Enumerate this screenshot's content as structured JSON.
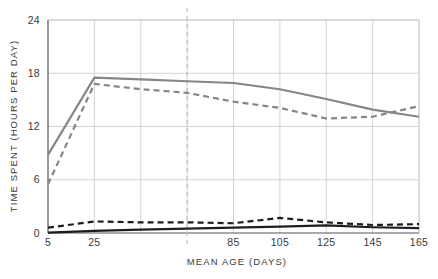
{
  "chart_data": {
    "type": "line",
    "title": "",
    "xlabel": "MEAN AGE (DAYS)",
    "ylabel": "TIME SPENT (HOURS PER DAY)",
    "xlim": [
      5,
      165
    ],
    "ylim": [
      0,
      24
    ],
    "grid": true,
    "legend": "none",
    "x_ticks": [
      5,
      25,
      45,
      65,
      85,
      105,
      125,
      145,
      165
    ],
    "x_tick_labels": [
      "5",
      "25",
      "",
      "",
      "85",
      "105",
      "125",
      "145",
      "165"
    ],
    "y_ticks": [
      0,
      6,
      12,
      18,
      24
    ],
    "y_tick_labels": [
      "0",
      "6",
      "12",
      "18",
      "24"
    ],
    "annotations": [
      {
        "name": "vertical-dashed-marker",
        "type": "vline",
        "x": 65,
        "style": "dashed",
        "color": "#b9b9b9"
      }
    ],
    "x": [
      5,
      25,
      45,
      65,
      85,
      105,
      125,
      145,
      165
    ],
    "series": [
      {
        "name": "resting-solid-gray",
        "style": "solid",
        "color": "#868686",
        "width": 2.2,
        "values": [
          8.8,
          17.5,
          17.3,
          17.1,
          16.9,
          16.2,
          15.1,
          13.9,
          13.1
        ]
      },
      {
        "name": "resting-dashed-gray",
        "style": "dashed",
        "color": "#868686",
        "width": 2.2,
        "values": [
          5.5,
          16.8,
          16.2,
          15.8,
          14.8,
          14.1,
          12.9,
          13.1,
          14.3
        ]
      },
      {
        "name": "activity-dashed-black",
        "style": "dashed",
        "color": "#1d1d1d",
        "width": 2.2,
        "values": [
          0.6,
          1.3,
          1.2,
          1.2,
          1.1,
          1.7,
          1.2,
          0.9,
          1.0
        ]
      },
      {
        "name": "activity-solid-black",
        "style": "solid",
        "color": "#1d1d1d",
        "width": 2.2,
        "values": [
          0.05,
          0.25,
          0.38,
          0.5,
          0.6,
          0.72,
          0.85,
          0.65,
          0.55
        ]
      }
    ]
  },
  "axes": {
    "x_title": "MEAN AGE (DAYS)",
    "y_title": "TIME SPENT (HOURS PER DAY)"
  },
  "colors": {
    "gray_series": "#868686",
    "black_series": "#1d1d1d",
    "grid": "#c9c9c9",
    "axis": "#555555",
    "marker": "#b9b9b9"
  }
}
